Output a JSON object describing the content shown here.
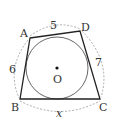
{
  "figure": {
    "vertices": {
      "A": "A",
      "B": "B",
      "C": "C",
      "D": "D"
    },
    "center_label": "O",
    "side_lengths": {
      "AD": "5",
      "AB": "6",
      "DC": "7",
      "BC": "x"
    },
    "colors": {
      "stroke": "#222222",
      "circle": "#555555",
      "dashed": "#888888",
      "text": "#333333"
    }
  }
}
